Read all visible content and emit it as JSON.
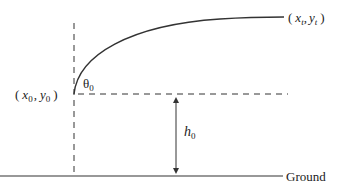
{
  "diagram": {
    "labels": {
      "start_point": {
        "open": "(",
        "x": "x",
        "x_sub": "0",
        "comma": ",",
        "y": "y",
        "y_sub": "0",
        "close": ")"
      },
      "end_point": {
        "open": "(",
        "x": "x",
        "x_sub": "t",
        "comma": ",",
        "y": "y",
        "y_sub": "t",
        "close": ")"
      },
      "angle": {
        "symbol": "θ",
        "sub": "0"
      },
      "height": {
        "symbol": "h",
        "sub": "0"
      },
      "ground": "Ground"
    },
    "colors": {
      "stroke": "#333333",
      "text": "#222222"
    }
  }
}
